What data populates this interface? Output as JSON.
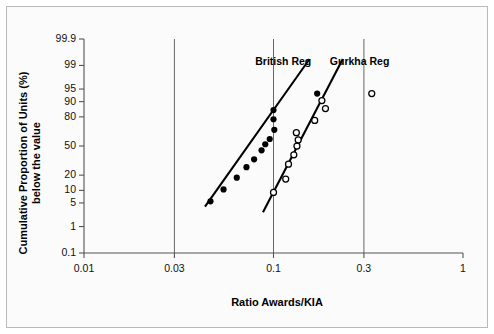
{
  "chart_data": {
    "type": "scatter",
    "title": "",
    "subtitle": "",
    "xlabel": "Ratio Awards/KIA",
    "ylabel": "Cumulative Proportion of Units (%) below the value",
    "ylabel_line1": "Cumulative Proportion of Units (%)",
    "ylabel_line2": "below the value",
    "x_scale": "log",
    "y_scale": "probability",
    "xlim": [
      0.01,
      1
    ],
    "ylim": [
      0.1,
      99.9
    ],
    "grid": "vertical-only",
    "legend_position": "inline-annotations",
    "x_ticks": [
      0.01,
      0.03,
      0.1,
      0.3,
      1
    ],
    "x_tick_labels": [
      "0.01",
      "0.03",
      "0.1",
      "0.3",
      "1"
    ],
    "y_ticks": [
      0.1,
      1,
      5,
      10,
      20,
      50,
      80,
      90,
      95,
      99,
      99.9
    ],
    "y_tick_labels": [
      "0.1",
      "1",
      "5",
      "10",
      "20",
      "50",
      "80",
      "90",
      "95",
      "99",
      "99.9"
    ],
    "gridlines_x": [
      0.03,
      0.1,
      0.3
    ],
    "series": [
      {
        "name": "British Reg",
        "marker": "filled-circle",
        "color": "#000000",
        "label_x": 0.095,
        "label_y": 99.2,
        "points": [
          {
            "x": 0.0465,
            "y": 5.5
          },
          {
            "x": 0.0545,
            "y": 10.5
          },
          {
            "x": 0.064,
            "y": 18.0
          },
          {
            "x": 0.072,
            "y": 27.0
          },
          {
            "x": 0.079,
            "y": 35.0
          },
          {
            "x": 0.0865,
            "y": 45.0
          },
          {
            "x": 0.0905,
            "y": 52.0
          },
          {
            "x": 0.0955,
            "y": 58.0
          },
          {
            "x": 0.101,
            "y": 68.0
          },
          {
            "x": 0.1,
            "y": 78.0
          },
          {
            "x": 0.1,
            "y": 85.0
          },
          {
            "x": 0.17,
            "y": 93.5
          }
        ],
        "fit_line": {
          "x1": 0.0435,
          "y1": 4.0,
          "x2": 0.155,
          "y2": 99.4
        }
      },
      {
        "name": "Gurkha Reg",
        "marker": "open-circle",
        "color": "#000000",
        "label_x": 0.235,
        "label_y": 99.2,
        "points": [
          {
            "x": 0.1,
            "y": 9.0
          },
          {
            "x": 0.116,
            "y": 17.0
          },
          {
            "x": 0.12,
            "y": 30.0
          },
          {
            "x": 0.128,
            "y": 40.0
          },
          {
            "x": 0.133,
            "y": 50.0
          },
          {
            "x": 0.135,
            "y": 57.0
          },
          {
            "x": 0.132,
            "y": 65.0
          },
          {
            "x": 0.165,
            "y": 77.0
          },
          {
            "x": 0.188,
            "y": 86.0
          },
          {
            "x": 0.18,
            "y": 90.5
          },
          {
            "x": 0.33,
            "y": 93.5
          }
        ],
        "fit_line": {
          "x1": 0.088,
          "y1": 2.8,
          "x2": 0.232,
          "y2": 99.4
        }
      }
    ]
  }
}
